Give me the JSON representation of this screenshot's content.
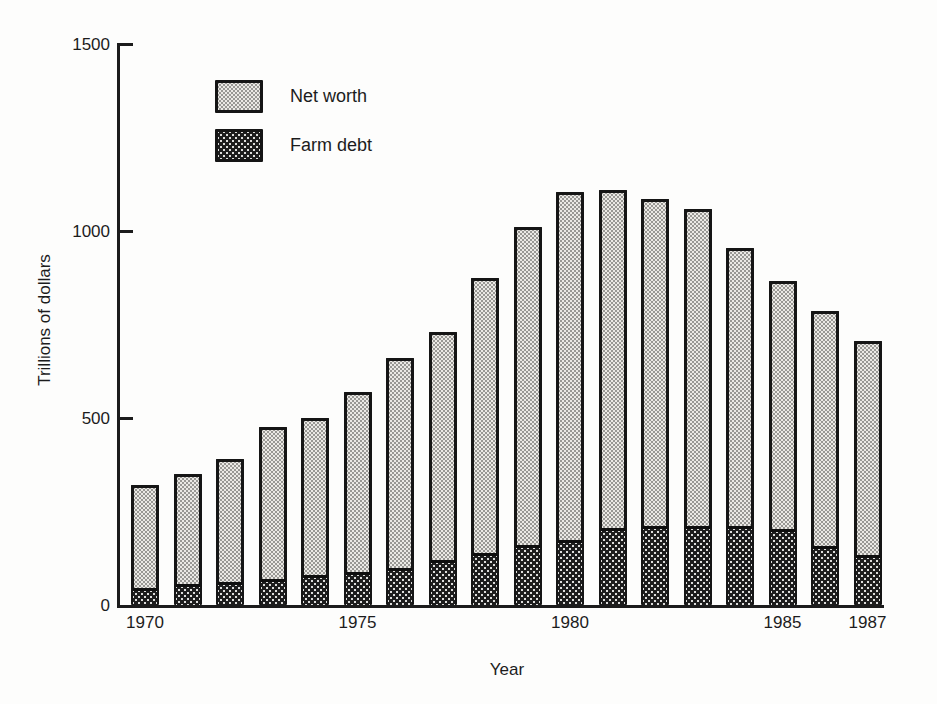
{
  "figure": {
    "y_axis_title": "Trillions of dollars",
    "x_axis_title": "Year",
    "legend": [
      {
        "label": "Net worth",
        "swatch": "net-worth"
      },
      {
        "label": "Farm debt",
        "swatch": "farm-debt"
      }
    ]
  },
  "chart_data": {
    "type": "bar",
    "stacked": true,
    "title": "",
    "xlabel": "Year",
    "ylabel": "Trillions of dollars",
    "ylim": [
      0,
      1500
    ],
    "grid": false,
    "legend_position": "upper-left-inside",
    "y_ticks": [
      0,
      500,
      1000,
      1500
    ],
    "x_tick_labels": [
      "1970",
      "1975",
      "1980",
      "1985",
      "1987"
    ],
    "x_tick_bar_indices": [
      0,
      5,
      10,
      15,
      17
    ],
    "categories": [
      "1970",
      "1971",
      "1972",
      "1973",
      "1974",
      "1975",
      "1976",
      "1977",
      "1978",
      "1979",
      "1980",
      "1981",
      "1982",
      "1983",
      "1984",
      "1985",
      "1986",
      "1987"
    ],
    "series": [
      {
        "name": "Farm debt",
        "values": [
          45,
          55,
          62,
          70,
          80,
          88,
          100,
          120,
          138,
          160,
          175,
          205,
          212,
          210,
          212,
          202,
          157,
          135
        ]
      },
      {
        "name": "Net worth",
        "values": [
          275,
          295,
          328,
          405,
          420,
          482,
          560,
          610,
          737,
          850,
          930,
          905,
          873,
          850,
          743,
          663,
          628,
          570
        ]
      }
    ],
    "totals": [
      320,
      350,
      390,
      475,
      500,
      570,
      660,
      730,
      875,
      1010,
      1105,
      1110,
      1085,
      1060,
      955,
      865,
      785,
      705
    ],
    "colors": {
      "net_worth_fill": "#ebe9e5",
      "farm_debt_fill": "#1d1d1d",
      "outline": "#151515",
      "axis": "#1c1c1c",
      "background": "#fdfdfc"
    }
  }
}
